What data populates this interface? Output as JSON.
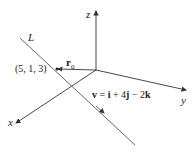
{
  "diagram": {
    "axes": {
      "z": "z",
      "y": "y",
      "x": "x"
    },
    "line_label": "L",
    "point_label": "(5, 1, 3)",
    "position_vector": {
      "symbol": "r",
      "subscript": "0"
    },
    "direction_vector": {
      "lhs": "v",
      "eq": " = ",
      "i": "i",
      "plus": " + 4",
      "j": "j",
      "minus": " − 2",
      "k": "k"
    },
    "colors": {
      "axes": "#333333",
      "line": "#555555",
      "background": "#ffffff"
    }
  }
}
